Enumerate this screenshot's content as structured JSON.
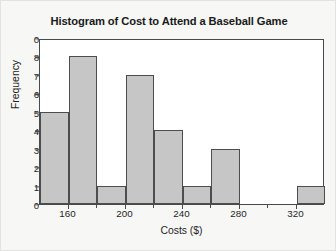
{
  "chart_data": {
    "type": "bar",
    "title": "Histogram of Cost to Attend a Baseball Game",
    "xlabel": "Costs ($)",
    "ylabel": "Frequency",
    "grid": false,
    "legend": "none",
    "xlim": [
      140,
      340
    ],
    "ylim": [
      0,
      9
    ],
    "bin_width": 20,
    "bin_edges": [
      140,
      160,
      180,
      200,
      220,
      240,
      260,
      280,
      300,
      320,
      340
    ],
    "categories": [
      "140-160",
      "160-180",
      "180-200",
      "200-220",
      "220-240",
      "240-260",
      "260-280",
      "280-300",
      "300-320",
      "320-340"
    ],
    "values": [
      5,
      8,
      1,
      7,
      4,
      1,
      3,
      0,
      0,
      1
    ],
    "x_tick_labels": [
      "160",
      "200",
      "240",
      "280",
      "320"
    ],
    "x_tick_values": [
      160,
      200,
      240,
      280,
      320
    ],
    "y_tick_labels": [
      "0",
      "8",
      "7",
      "6",
      "5",
      "4",
      "3",
      "2",
      "1",
      "0"
    ],
    "y_tick_values": [
      9,
      8,
      7,
      6,
      5,
      4,
      3,
      2,
      1,
      0
    ],
    "bar_color": "#c6c6c6",
    "bar_edge_color": "#4d4d4d",
    "axis_color": "#4a4a4a",
    "plot_background": "#ffffff",
    "figure_background": "#f7f7f6"
  }
}
